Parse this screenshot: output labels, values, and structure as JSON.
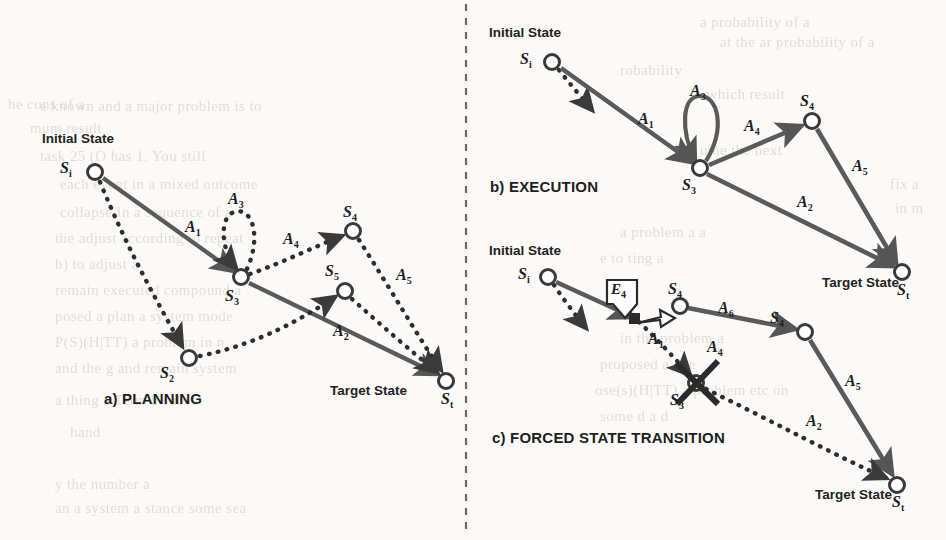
{
  "figure": {
    "divider": "vertical-dashed-line",
    "ink_color": "#5a5a5a",
    "stroke_color": "#555555",
    "text_color": "#232323",
    "background_color": "#fbfaf8"
  },
  "panels": [
    {
      "id": "a",
      "caption": "a) PLANNING",
      "initial_state_label": "Initial State",
      "target_state_label": "Target State",
      "nodes": [
        {
          "name": "Si",
          "letter": "S",
          "sub": "i",
          "x": 95,
          "y": 172
        },
        {
          "name": "S2",
          "letter": "S",
          "sub": "2",
          "x": 189,
          "y": 358
        },
        {
          "name": "S3",
          "letter": "S",
          "sub": "3",
          "x": 241,
          "y": 277
        },
        {
          "name": "S4",
          "letter": "S",
          "sub": "4",
          "x": 353,
          "y": 231
        },
        {
          "name": "S5",
          "letter": "S",
          "sub": "5",
          "x": 345,
          "y": 291
        },
        {
          "name": "St",
          "letter": "S",
          "sub": "t",
          "x": 446,
          "y": 381
        }
      ],
      "edges": [
        {
          "label": "A1",
          "letter": "A",
          "sub": "1",
          "from": "Si",
          "to": "S3",
          "style": "solid"
        },
        {
          "label": "A3",
          "letter": "A",
          "sub": "3",
          "from": "S3",
          "to": "S3",
          "style": "dotted",
          "kind": "self-loop"
        },
        {
          "label": "A4",
          "letter": "A",
          "sub": "4",
          "from": "S3",
          "to": "S4",
          "style": "dotted"
        },
        {
          "label": "A5",
          "letter": "A",
          "sub": "5",
          "from": "S4",
          "to": "St",
          "style": "dotted"
        },
        {
          "label": "A2",
          "letter": "A",
          "sub": "2",
          "from": "S3",
          "to": "St",
          "style": "solid"
        },
        {
          "label": "",
          "letter": "",
          "sub": "",
          "from": "Si",
          "to": "S2",
          "style": "dotted"
        },
        {
          "label": "",
          "letter": "",
          "sub": "",
          "from": "S2",
          "to": "S5",
          "style": "dotted"
        },
        {
          "label": "",
          "letter": "",
          "sub": "",
          "from": "S5",
          "to": "St",
          "style": "dotted"
        }
      ]
    },
    {
      "id": "b",
      "caption": "b) EXECUTION",
      "initial_state_label": "Initial State",
      "target_state_label": "Target State",
      "nodes": [
        {
          "name": "Si",
          "letter": "S",
          "sub": "i",
          "x": 552,
          "y": 62
        },
        {
          "name": "S3",
          "letter": "S",
          "sub": "3",
          "x": 700,
          "y": 168
        },
        {
          "name": "S4",
          "letter": "S",
          "sub": "4",
          "x": 812,
          "y": 121
        },
        {
          "name": "St",
          "letter": "S",
          "sub": "t",
          "x": 902,
          "y": 272
        }
      ],
      "edges": [
        {
          "label": "A1",
          "letter": "A",
          "sub": "1",
          "from": "Si",
          "to": "S3",
          "style": "solid"
        },
        {
          "label": "A3",
          "letter": "A",
          "sub": "3",
          "from": "S3",
          "to": "S3",
          "style": "solid",
          "kind": "self-loop"
        },
        {
          "label": "A4",
          "letter": "A",
          "sub": "4",
          "from": "S3",
          "to": "S4",
          "style": "solid"
        },
        {
          "label": "A5",
          "letter": "A",
          "sub": "5",
          "from": "S4",
          "to": "St",
          "style": "solid"
        },
        {
          "label": "A2",
          "letter": "A",
          "sub": "2",
          "from": "S3",
          "to": "St",
          "style": "solid"
        },
        {
          "label": "",
          "letter": "",
          "sub": "",
          "from": "Si",
          "to": "stub",
          "style": "dotted"
        }
      ]
    },
    {
      "id": "c",
      "caption": "c) FORCED STATE TRANSITION",
      "initial_state_label": "Initial State",
      "target_state_label": "Target State",
      "event_label": "E4",
      "event_letter": "E",
      "event_sub": "4",
      "blocked_node": "S3",
      "nodes": [
        {
          "name": "Si",
          "letter": "S",
          "sub": "i",
          "x": 548,
          "y": 277
        },
        {
          "name": "Sx",
          "letter": "",
          "sub": "",
          "x": 634,
          "y": 318
        },
        {
          "name": "S4a",
          "letter": "S",
          "sub": "4",
          "x": 680,
          "y": 306
        },
        {
          "name": "S3",
          "letter": "S",
          "sub": "3",
          "x": 696,
          "y": 383
        },
        {
          "name": "S4b",
          "letter": "S",
          "sub": "4",
          "x": 805,
          "y": 332
        },
        {
          "name": "St",
          "letter": "S",
          "sub": "t",
          "x": 897,
          "y": 485
        }
      ],
      "edges": [
        {
          "label": "A1",
          "letter": "A",
          "sub": "1",
          "from": "Sx",
          "to": "S3",
          "style": "dotted"
        },
        {
          "label": "A6",
          "letter": "A",
          "sub": "6",
          "from": "S4a",
          "to": "S4b",
          "style": "solid"
        },
        {
          "label": "A4",
          "letter": "A",
          "sub": "4",
          "from": "S4a",
          "to": "S4b",
          "style": "solid"
        },
        {
          "label": "A5",
          "letter": "A",
          "sub": "5",
          "from": "S4b",
          "to": "St",
          "style": "solid"
        },
        {
          "label": "A2",
          "letter": "A",
          "sub": "2",
          "from": "S3",
          "to": "St",
          "style": "dotted"
        },
        {
          "label": "",
          "letter": "",
          "sub": "",
          "from": "Si",
          "to": "Sx",
          "style": "solid"
        },
        {
          "label": "",
          "letter": "",
          "sub": "",
          "from": "Si",
          "to": "stub",
          "style": "dotted"
        },
        {
          "label": "",
          "letter": "",
          "sub": "",
          "from": "Sx",
          "to": "S4a",
          "style": "hollow-arrow"
        }
      ]
    }
  ],
  "labels": {
    "a": {
      "caption": "a) PLANNING",
      "initial": "Initial State",
      "target": "Target State",
      "Si": {
        "l": "S",
        "s": "i"
      },
      "S2": {
        "l": "S",
        "s": "2"
      },
      "S3": {
        "l": "S",
        "s": "3"
      },
      "S4": {
        "l": "S",
        "s": "4"
      },
      "S5": {
        "l": "S",
        "s": "5"
      },
      "St": {
        "l": "S",
        "s": "t"
      },
      "A1": {
        "l": "A",
        "s": "1"
      },
      "A2": {
        "l": "A",
        "s": "2"
      },
      "A3": {
        "l": "A",
        "s": "3"
      },
      "A4": {
        "l": "A",
        "s": "4"
      },
      "A5": {
        "l": "A",
        "s": "5"
      }
    },
    "b": {
      "caption": "b) EXECUTION",
      "initial": "Initial State",
      "target": "Target State",
      "Si": {
        "l": "S",
        "s": "i"
      },
      "S3": {
        "l": "S",
        "s": "3"
      },
      "S4": {
        "l": "S",
        "s": "4"
      },
      "St": {
        "l": "S",
        "s": "t"
      },
      "A1": {
        "l": "A",
        "s": "1"
      },
      "A2": {
        "l": "A",
        "s": "2"
      },
      "A3": {
        "l": "A",
        "s": "3"
      },
      "A4": {
        "l": "A",
        "s": "4"
      },
      "A5": {
        "l": "A",
        "s": "5"
      }
    },
    "c": {
      "caption": "c) FORCED STATE TRANSITION",
      "initial": "Initial State",
      "target": "Target State",
      "Si": {
        "l": "S",
        "s": "i"
      },
      "S3": {
        "l": "S",
        "s": "3"
      },
      "S4a": {
        "l": "S",
        "s": "4"
      },
      "S4b": {
        "l": "S",
        "s": "4"
      },
      "St": {
        "l": "S",
        "s": "t"
      },
      "E4": {
        "l": "E",
        "s": "4"
      },
      "A1": {
        "l": "A",
        "s": "1"
      },
      "A2": {
        "l": "A",
        "s": "2"
      },
      "A4": {
        "l": "A",
        "s": "4"
      },
      "A5": {
        "l": "A",
        "s": "5"
      },
      "A6": {
        "l": "A",
        "s": "6"
      }
    }
  },
  "bleed_through_text": [
    {
      "t": "a probability of a",
      "x": 700,
      "y": 14
    },
    {
      "t": "he cons of a",
      "x": 8,
      "y": 96
    },
    {
      "t": "at the ar probability of a",
      "x": 720,
      "y": 34
    },
    {
      "t": "e known and a major problem is to",
      "x": 40,
      "y": 98
    },
    {
      "t": "robability",
      "x": 620,
      "y": 62
    },
    {
      "t": "mum result",
      "x": 30,
      "y": 120
    },
    {
      "t": "in which result",
      "x": 690,
      "y": 86
    },
    {
      "t": "task 25 (O    has 1. You still",
      "x": 40,
      "y": 148
    },
    {
      "t": "ume the next",
      "x": 700,
      "y": 142
    },
    {
      "t": "each event   in a mixed outcome",
      "x": 60,
      "y": 176
    },
    {
      "t": "fix a",
      "x": 890,
      "y": 176
    },
    {
      "t": "collapse  In a sequence of a",
      "x": 60,
      "y": 204
    },
    {
      "t": "in m",
      "x": 895,
      "y": 200
    },
    {
      "t": "the adjust according to  repeat",
      "x": 55,
      "y": 230
    },
    {
      "t": "b) to adjust a",
      "x": 55,
      "y": 256
    },
    {
      "t": "remain  executed compound  a",
      "x": 55,
      "y": 282
    },
    {
      "t": "posed a  plan a system  mode",
      "x": 55,
      "y": 308
    },
    {
      "t": "P(S)(H|TT) a problem in n",
      "x": 55,
      "y": 334
    },
    {
      "t": "and the g  and remain  system",
      "x": 55,
      "y": 360
    },
    {
      "t": "a   thing a   Term a subset",
      "x": 55,
      "y": 392
    },
    {
      "t": "hand",
      "x": 70,
      "y": 424
    },
    {
      "t": "y the number  a",
      "x": 55,
      "y": 476
    },
    {
      "t": "an  a system  a  stance some  sea",
      "x": 55,
      "y": 500
    },
    {
      "t": "in the  problem a",
      "x": 620,
      "y": 330
    },
    {
      "t": "proposed  a  site",
      "x": 600,
      "y": 356
    },
    {
      "t": "ose(s)(H|TT) a problem etc on",
      "x": 595,
      "y": 382
    },
    {
      "t": "some  d     a     d",
      "x": 600,
      "y": 408
    },
    {
      "t": "e to  ting  a",
      "x": 600,
      "y": 250
    },
    {
      "t": "a problem  a   a",
      "x": 620,
      "y": 224
    }
  ]
}
